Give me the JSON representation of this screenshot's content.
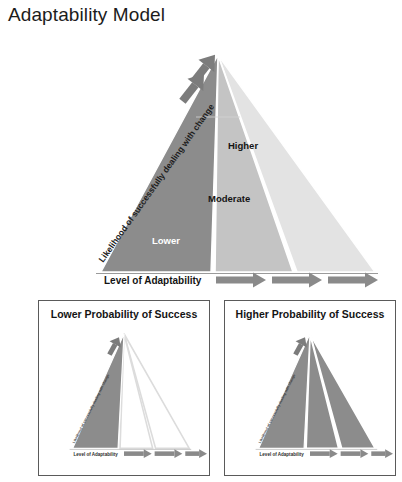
{
  "page": {
    "title": "Adaptability Model",
    "background": "#ffffff"
  },
  "colors": {
    "band_lower": "#8c8c8c",
    "band_moderate": "#c4c4c4",
    "band_higher": "#e3e3e3",
    "arrow": "#8a8a8a",
    "arrow_dark": "#6f6f6f",
    "outline": "#bdbdbd",
    "panel_border": "#5a5a5a",
    "text_dark": "#141414",
    "text_light": "#ffffff"
  },
  "main_diagram": {
    "name": "adaptability-triangle",
    "bands": [
      {
        "key": "lower",
        "label": "Lower",
        "fill": "#8c8c8c",
        "text_color": "#ffffff"
      },
      {
        "key": "moderate",
        "label": "Moderate",
        "fill": "#c4c4c4",
        "text_color": "#141414"
      },
      {
        "key": "higher",
        "label": "Higher",
        "fill": "#e3e3e3",
        "text_color": "#141414"
      }
    ],
    "x_axis_label": "Level of Adaptability",
    "y_axis_label": "Likelihood of successfully dealing with change",
    "x_axis_arrow_count": 3,
    "apex_arrow_count": 2
  },
  "panels": [
    {
      "key": "lower-probability",
      "title": "Lower Probability of Success",
      "x_axis_label": "Level of Adaptability",
      "y_axis_label": "Likelihood of successfully dealing with change",
      "filled_bands": [
        "lower"
      ],
      "outlined_bands": [
        "moderate",
        "higher"
      ],
      "x_axis_arrow_count": 3
    },
    {
      "key": "higher-probability",
      "title": "Higher Probability of Success",
      "x_axis_label": "Level of Adaptability",
      "y_axis_label": "Likelihood of successfully dealing with change",
      "filled_bands": [
        "lower",
        "moderate",
        "higher"
      ],
      "outlined_bands": [],
      "x_axis_arrow_count": 3
    }
  ]
}
